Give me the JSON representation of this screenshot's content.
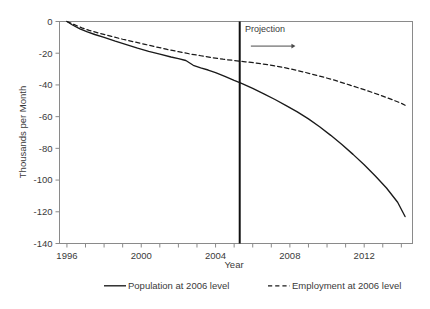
{
  "chart_data": {
    "type": "line",
    "title": "",
    "xlabel": "Year",
    "ylabel": "Thousands per Month",
    "xlim": [
      1995.6,
      2014.6
    ],
    "ylim": [
      -140,
      0
    ],
    "xticks": [
      1996,
      2000,
      2004,
      2008,
      2012
    ],
    "xtick_labels": [
      "1996",
      "2000",
      "2004",
      "2008",
      "2012"
    ],
    "xminor_step": 1,
    "yticks": [
      0,
      -20,
      -40,
      -60,
      -80,
      -100,
      -120,
      -140
    ],
    "ytick_labels": [
      "0",
      "-20",
      "-40",
      "-60",
      "-80",
      "-100",
      "-120",
      "-140"
    ],
    "grid": false,
    "legend_position": "bottom",
    "annotations": [
      {
        "name": "projection-label",
        "text": "Projection",
        "x": 2006.2,
        "y": -8.5
      },
      {
        "name": "projection-divider",
        "type": "vline",
        "x": 2005.3
      },
      {
        "name": "projection-arrow",
        "type": "arrow",
        "x_start": 2005.9,
        "x_end": 2008.3,
        "y": -15.5
      }
    ],
    "series": [
      {
        "name": "Population at 2006 level",
        "style": "solid",
        "color": "#1a1a1a",
        "x": [
          1996.0,
          1996.3,
          1996.7,
          1997.1,
          1997.5,
          1998.0,
          1998.6,
          1999.2,
          1999.8,
          2000.4,
          2001.0,
          2001.6,
          2002.0,
          2002.4,
          2002.8,
          2003.2,
          2003.6,
          2004.0,
          2004.5,
          2005.0,
          2005.4,
          2006.0,
          2006.6,
          2007.2,
          2007.8,
          2008.4,
          2009.0,
          2009.6,
          2010.2,
          2010.8,
          2011.4,
          2012.0,
          2012.6,
          2013.2,
          2013.8,
          2014.2
        ],
        "y": [
          0.0,
          -2.2,
          -4.6,
          -6.6,
          -8.2,
          -10.0,
          -12.4,
          -14.6,
          -16.8,
          -18.8,
          -20.6,
          -22.4,
          -23.4,
          -24.6,
          -27.6,
          -29.2,
          -30.6,
          -32.2,
          -34.6,
          -37.2,
          -39.0,
          -42.2,
          -45.6,
          -49.2,
          -53.0,
          -57.0,
          -61.4,
          -66.4,
          -71.8,
          -77.6,
          -83.8,
          -90.4,
          -97.4,
          -105.0,
          -114.0,
          -123.0
        ]
      },
      {
        "name": "Employment at 2006 level",
        "style": "dashed",
        "color": "#1a1a1a",
        "x": [
          1996.0,
          1996.4,
          1996.8,
          1997.2,
          1997.8,
          1998.4,
          1999.0,
          1999.6,
          2000.2,
          2000.8,
          2001.4,
          2002.0,
          2002.6,
          2003.2,
          2003.8,
          2004.4,
          2005.0,
          2005.6,
          2006.2,
          2006.8,
          2007.4,
          2008.0,
          2008.8,
          2009.6,
          2010.4,
          2011.2,
          2012.0,
          2012.8,
          2013.4,
          2014.0,
          2014.2
        ],
        "y": [
          0.0,
          -2.0,
          -4.0,
          -5.6,
          -7.6,
          -9.4,
          -11.2,
          -12.8,
          -14.4,
          -16.0,
          -17.6,
          -19.0,
          -20.4,
          -21.6,
          -22.8,
          -23.8,
          -24.6,
          -25.4,
          -26.2,
          -27.2,
          -28.4,
          -29.8,
          -32.0,
          -34.4,
          -37.0,
          -40.0,
          -43.0,
          -46.2,
          -48.8,
          -51.6,
          -52.8
        ]
      }
    ]
  },
  "axes": {
    "ylabel": "Thousands per Month",
    "xlabel": "Year"
  },
  "legend": {
    "items": [
      {
        "label": "Population at 2006 level",
        "style": "solid"
      },
      {
        "label": "Employment at 2006 level",
        "style": "dashed"
      }
    ]
  },
  "annotation": {
    "projection": "Projection"
  }
}
